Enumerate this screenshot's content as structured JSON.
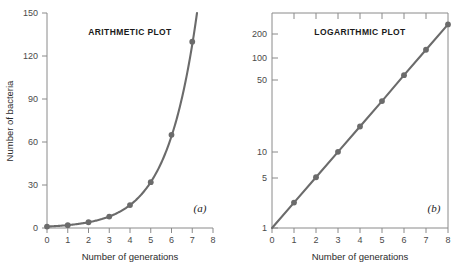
{
  "figure": {
    "background": "#ffffff",
    "line_color": "#6b6b6b",
    "axis_color": "#8a8a8a",
    "text_color": "#2b2b2b"
  },
  "chart_data": [
    {
      "type": "line",
      "title": "ARITHMETIC PLOT",
      "panel_label": "(a)",
      "xlabel": "Number of generations",
      "ylabel": "Number of bacteria",
      "x": [
        0,
        1,
        2,
        3,
        4,
        5,
        6,
        7
      ],
      "values": [
        1,
        2,
        4,
        8,
        16,
        32,
        65,
        130
      ],
      "xlim": [
        0,
        8
      ],
      "ylim": [
        0,
        150
      ],
      "xticks": [
        0,
        1,
        2,
        3,
        4,
        5,
        6,
        7,
        8
      ],
      "xticklabels": [
        "0",
        "1",
        "2",
        "3",
        "4",
        "5",
        "6",
        "7",
        "8"
      ],
      "yticks": [
        0,
        30,
        60,
        90,
        120,
        150
      ],
      "yticklabels": [
        "0",
        "30",
        "60",
        "90",
        "120",
        "150"
      ],
      "yscale": "linear",
      "grid": false,
      "legend": "none",
      "markers": true
    },
    {
      "type": "line",
      "title": "LOGARITHMIC PLOT",
      "panel_label": "(b)",
      "xlabel": "Number of generations",
      "ylabel": "",
      "x": [
        0,
        1,
        2,
        3,
        4,
        5,
        6,
        7,
        8
      ],
      "values": [
        1,
        2,
        4,
        8,
        16,
        32,
        65,
        130,
        260
      ],
      "xlim": [
        0,
        8
      ],
      "ylim": [
        1,
        260
      ],
      "xticks": [
        0,
        1,
        2,
        3,
        4,
        5,
        6,
        7,
        8
      ],
      "xticklabels": [
        "0",
        "1",
        "2",
        "3",
        "4",
        "5",
        "6",
        "7",
        "8"
      ],
      "yticks": [
        1,
        5,
        10,
        50,
        100,
        200
      ],
      "yticklabels": [
        "1",
        "5",
        "10",
        "50",
        "100",
        "200"
      ],
      "yscale": "log",
      "grid": false,
      "legend": "none",
      "markers": true
    }
  ],
  "left_plot": {
    "title": "ARITHMETIC PLOT",
    "panel_label": "(a)",
    "xlabel": "Number of generations",
    "ylabel": "Number of bacteria",
    "xticklabels": [
      "0",
      "1",
      "2",
      "3",
      "4",
      "5",
      "6",
      "7",
      "8"
    ],
    "yticklabels": [
      "0",
      "30",
      "60",
      "90",
      "120",
      "150"
    ]
  },
  "right_plot": {
    "title": "LOGARITHMIC PLOT",
    "panel_label": "(b)",
    "xlabel": "Number of generations",
    "ylabel": "",
    "xticklabels": [
      "0",
      "1",
      "2",
      "3",
      "4",
      "5",
      "6",
      "7",
      "8"
    ],
    "yticklabels": [
      "1",
      "5",
      "10",
      "50",
      "100",
      "200"
    ]
  }
}
